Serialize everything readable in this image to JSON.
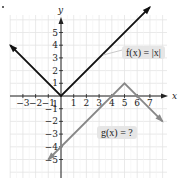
{
  "chart_data": {
    "type": "line",
    "title": "",
    "xlabel": "x",
    "ylabel": "y",
    "xlim": [
      -4,
      8
    ],
    "ylim": [
      -6,
      6
    ],
    "grid": true,
    "x_ticks": [
      -3,
      -2,
      -1,
      1,
      2,
      3,
      4,
      5,
      6,
      7
    ],
    "y_ticks": [
      5,
      4,
      3,
      2,
      1,
      -1,
      -2,
      -3,
      -4,
      -5
    ],
    "x_tick_labels": [
      "−3",
      "−2",
      "−1",
      "1",
      "2",
      "3",
      "4",
      "5",
      "6",
      "7"
    ],
    "y_tick_labels": [
      "5",
      "4",
      "3",
      "2",
      "1",
      "−1",
      "−2",
      "−3",
      "−4",
      "−5"
    ],
    "series": [
      {
        "name": "f(x) = |x|",
        "color": "#111111",
        "x": [
          -4,
          0,
          7
        ],
        "y": [
          4,
          0,
          7
        ]
      },
      {
        "name": "g(x) = ?",
        "color": "#888888",
        "x": [
          -1,
          5,
          8
        ],
        "y": [
          -5,
          1,
          -2
        ]
      }
    ],
    "annotations": [
      {
        "text": "f(x) = |x|",
        "x": 6.2,
        "y": 3.2
      },
      {
        "text": "g(x) = ?",
        "x": 4.2,
        "y": -2.8
      }
    ]
  },
  "labels": {
    "f_label": "f(x) = |x|",
    "g_label": "g(x) = ?",
    "x_axis": "x",
    "y_axis": "y"
  }
}
